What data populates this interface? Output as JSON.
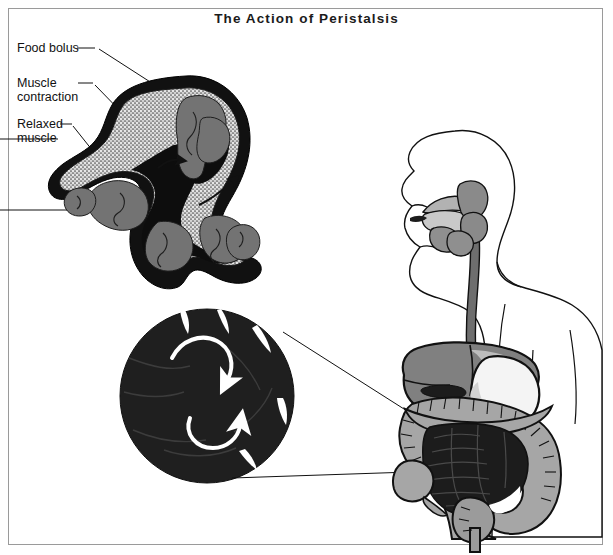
{
  "figure": {
    "title": "The Action of Peristalsis",
    "type": "anatomical-illustration",
    "border_color": "#9a9a9a",
    "background_color": "#ffffff"
  },
  "labels": [
    {
      "id": "food-bolus",
      "text": "Food bolus",
      "x": 17,
      "y": 42,
      "dash": "—"
    },
    {
      "id": "muscle-contraction",
      "text": "Muscle\ncontraction",
      "x": 17,
      "y": 77,
      "dash": "—"
    },
    {
      "id": "relaxed-muscle",
      "text": "Relaxed\nmuscle",
      "x": 17,
      "y": 118,
      "dash": "—"
    }
  ],
  "panels": {
    "cross_section": {
      "name": "peristalsis-cross-section",
      "description": "S-shaped longitudinal cross-section of intestine showing contracted and relaxed segments with food bolus",
      "arrow_count": 2,
      "arrow_direction": "toward lower right / propulsion"
    },
    "magnified_circle": {
      "name": "magnified-intestine-inset",
      "description": "Circular magnified view of intestinal loops with white circulation arrows",
      "center_x": 207,
      "center_y": 396,
      "radius": 87,
      "arrow_count": 2
    },
    "body_figure": {
      "name": "human-digestive-system",
      "description": "Profile of human head and torso showing mouth, esophagus, stomach, liver, small and large intestine",
      "organs": [
        {
          "name": "mouth-tongue",
          "shade": "#a9a9a9"
        },
        {
          "name": "pharynx",
          "shade": "#7d7d7d"
        },
        {
          "name": "esophagus",
          "shade": "#6e6e6e"
        },
        {
          "name": "liver",
          "shade": "#808080"
        },
        {
          "name": "stomach",
          "shade": "#f2f2f2"
        },
        {
          "name": "gallbladder",
          "shade": "#2b2b2b"
        },
        {
          "name": "large-intestine",
          "shade": "#a6a6a6"
        },
        {
          "name": "small-intestine",
          "shade": "#1c1c1c"
        },
        {
          "name": "rectum",
          "shade": "#9b9b9b"
        }
      ]
    }
  },
  "colors": {
    "outer_muscle": "#111111",
    "mucosa_stipple": "#d9d9d9",
    "bolus_gray": "#737373",
    "lumen": "#101010",
    "line": "#111111",
    "inset_fill": "#1f1f1f",
    "inset_arrow": "#ffffff",
    "text": "#111111"
  }
}
